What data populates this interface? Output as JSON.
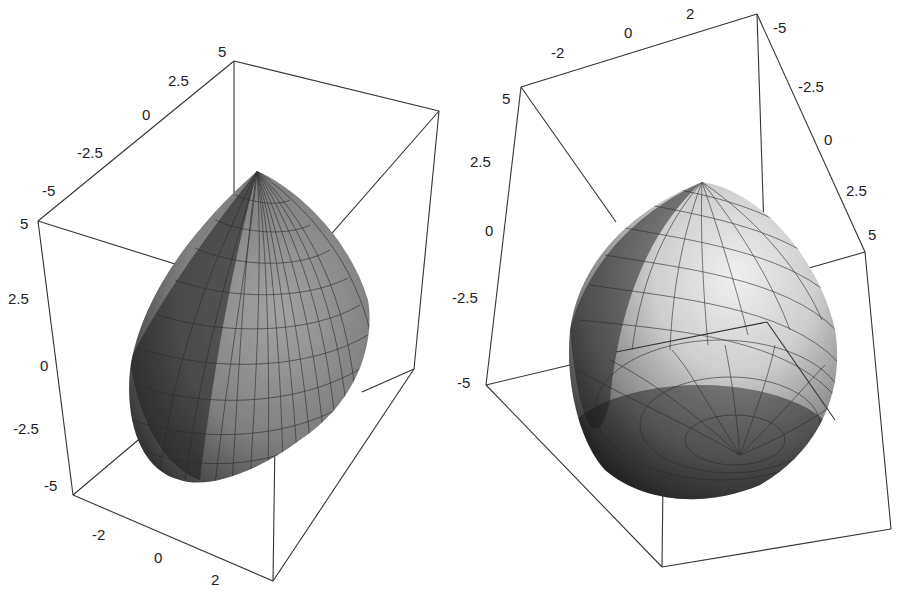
{
  "figure": {
    "panels": [
      {
        "id": "left",
        "description": "3D parametric surface (teardrop/ovoid) inside bounding box, viewed from above, apex up",
        "axes": {
          "diagonal_top": {
            "ticks": [
              "-5",
              "-2.5",
              "0",
              "2.5",
              "5"
            ]
          },
          "vertical_left": {
            "ticks": [
              "5",
              "2.5",
              "0",
              "-2.5",
              "-5"
            ]
          },
          "bottom": {
            "ticks": [
              "-2",
              "0",
              "2"
            ]
          }
        }
      },
      {
        "id": "right",
        "description": "Same 3D surface rendered from a different viewpoint with lighter shading, pole visible at bottom",
        "axes": {
          "top": {
            "ticks": [
              "-2",
              "0",
              "2"
            ]
          },
          "vertical_left": {
            "ticks": [
              "5",
              "2.5",
              "0",
              "-2.5",
              "-5"
            ]
          },
          "diagonal_right": {
            "ticks": [
              "-5",
              "-2.5",
              "0",
              "2.5",
              "5"
            ]
          }
        }
      }
    ]
  },
  "colors": {
    "background": "#ffffff",
    "box_line": "#333333",
    "surface_dark": "#2b2b2b",
    "surface_mid": "#7a7a7a",
    "surface_light": "#d9d9d9"
  }
}
